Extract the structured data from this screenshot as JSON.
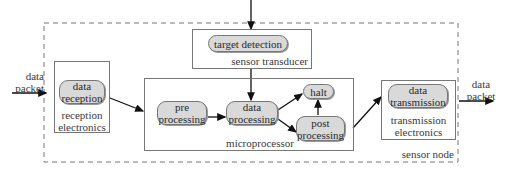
{
  "diagram": {
    "container_label": "sensor node",
    "input": {
      "label_line1": "data",
      "label_line2": "packet"
    },
    "output": {
      "label_line1": "data",
      "label_line2": "packet"
    },
    "modules": {
      "reception": {
        "label_line1": "reception",
        "label_line2": "electronics",
        "node": {
          "line1": "data",
          "line2": "reception"
        }
      },
      "sensor": {
        "label": "sensor transducer",
        "node": {
          "line1": "target detection"
        }
      },
      "microprocessor": {
        "label": "microprocessor",
        "nodes": {
          "pre": {
            "line1": "pre",
            "line2": "processing"
          },
          "data": {
            "line1": "data",
            "line2": "processing"
          },
          "halt": {
            "line1": "halt"
          },
          "post": {
            "line1": "post",
            "line2": "processing"
          }
        }
      },
      "transmission": {
        "label_line1": "transmission",
        "label_line2": "electronics",
        "node": {
          "line1": "data",
          "line2": "transmission"
        }
      }
    },
    "edges": [
      "data packet -> data reception",
      "data reception -> pre processing",
      "target detection -> data processing",
      "pre processing -> data processing",
      "data processing -> halt",
      "data processing -> post processing",
      "post processing -> halt",
      "post processing -> data transmission",
      "data transmission -> data packet"
    ]
  }
}
